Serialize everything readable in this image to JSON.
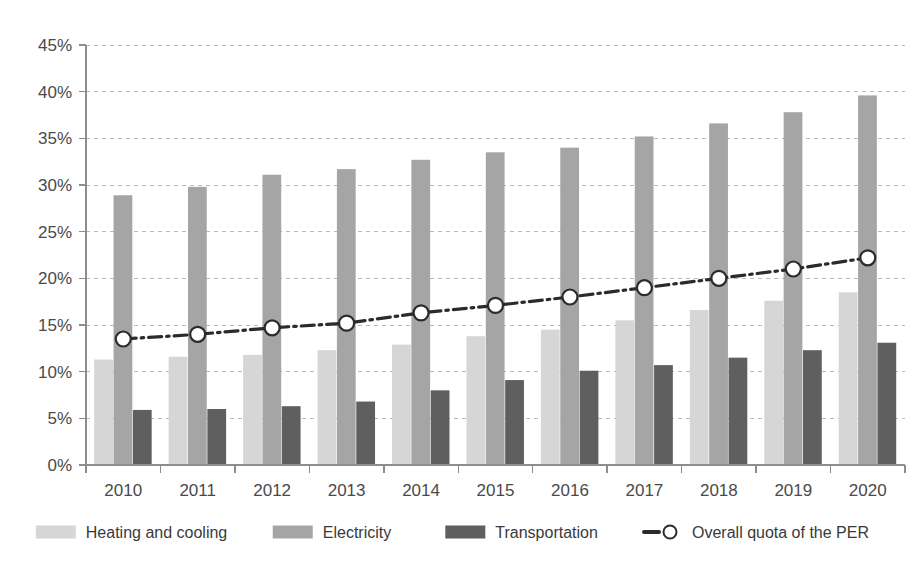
{
  "chart_data": {
    "type": "bar",
    "title": "",
    "subtitle": "",
    "xlabel": "",
    "ylabel": "",
    "categories": [
      "2010",
      "2011",
      "2012",
      "2013",
      "2014",
      "2015",
      "2016",
      "2017",
      "2018",
      "2019",
      "2020"
    ],
    "ylim": [
      0,
      45
    ],
    "ytick_values": [
      0,
      5,
      10,
      15,
      20,
      25,
      30,
      35,
      40,
      45
    ],
    "ytick_labels": [
      "0%",
      "5%",
      "10%",
      "15%",
      "20%",
      "25%",
      "30%",
      "35%",
      "40%",
      "45%"
    ],
    "grid": true,
    "grid_axis": "y",
    "legend_position": "bottom",
    "value_suffix": "%",
    "series": [
      {
        "name": "Heating and cooling",
        "kind": "bar",
        "color": "#d6d6d6",
        "values": [
          11.3,
          11.6,
          11.8,
          12.3,
          12.9,
          13.8,
          14.5,
          15.5,
          16.6,
          17.6,
          18.5
        ]
      },
      {
        "name": "Electricity",
        "kind": "bar",
        "color": "#a5a5a5",
        "values": [
          28.9,
          29.8,
          31.1,
          31.7,
          32.7,
          33.5,
          34.0,
          35.2,
          36.6,
          37.8,
          39.6
        ]
      },
      {
        "name": "Transportation",
        "kind": "bar",
        "color": "#5f5f5f",
        "values": [
          5.9,
          6.0,
          6.3,
          6.8,
          8.0,
          9.1,
          10.1,
          10.7,
          11.5,
          12.3,
          13.1
        ]
      },
      {
        "name": "Overall quota of the PER",
        "kind": "line",
        "color": "#2b2b2b",
        "marker": "open-circle",
        "line_style": "dash-dot",
        "values": [
          13.5,
          14.0,
          14.7,
          15.2,
          16.3,
          17.1,
          18.0,
          19.0,
          20.0,
          21.0,
          22.2
        ]
      }
    ]
  },
  "legend": {
    "items": [
      {
        "label": "Heating and cooling",
        "swatch": "#d6d6d6",
        "type": "swatch"
      },
      {
        "label": "Electricity",
        "swatch": "#a5a5a5",
        "type": "swatch"
      },
      {
        "label": "Transportation",
        "swatch": "#5f5f5f",
        "type": "swatch"
      },
      {
        "label": "Overall quota of the PER",
        "swatch": "#2b2b2b",
        "type": "line-marker"
      }
    ]
  },
  "axes": {
    "y_axis_name": "percentage-axis",
    "x_axis_name": "year-axis"
  }
}
